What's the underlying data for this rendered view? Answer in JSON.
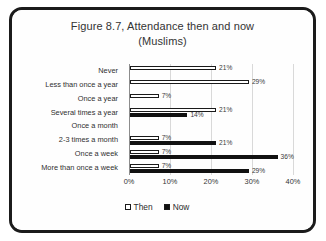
{
  "chart_data": {
    "type": "bar",
    "orientation": "horizontal",
    "title": "Figure 8.7, Attendance then and now (Muslims)",
    "title_line1": "Figure 8.7, Attendance then and now",
    "title_line2": "(Muslims)",
    "xlabel": "",
    "ylabel": "",
    "xlim": [
      0,
      40
    ],
    "xticks": [
      "0%",
      "10%",
      "20%",
      "30%",
      "40%"
    ],
    "xtick_values": [
      0,
      10,
      20,
      30,
      40
    ],
    "grid": true,
    "legend_position": "bottom",
    "categories": [
      "Never",
      "Less than once a year",
      "Once a year",
      "Several times a year",
      "Once a month",
      "2-3 times a month",
      "Once a week",
      "More than once a week"
    ],
    "series": [
      {
        "name": "Then",
        "color": "#ffffff",
        "values": [
          21,
          29,
          7,
          21,
          null,
          7,
          7,
          7
        ],
        "labels": [
          "21%",
          "29%",
          "7%",
          "21%",
          "",
          "7%",
          "7%",
          "7%"
        ]
      },
      {
        "name": "Now",
        "color": "#111111",
        "values": [
          null,
          null,
          null,
          14,
          null,
          21,
          36,
          29
        ],
        "labels": [
          "",
          "",
          "",
          "14%",
          "",
          "21%",
          "36%",
          "29%"
        ]
      }
    ]
  },
  "legend": {
    "items": [
      {
        "label": "Then",
        "swatch": "white-square"
      },
      {
        "label": "Now",
        "swatch": "black-square"
      }
    ]
  }
}
